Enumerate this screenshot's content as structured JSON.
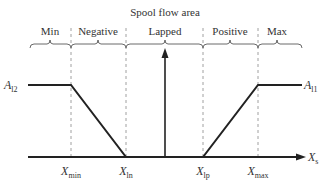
{
  "title": "Spool flow area",
  "regions": [
    {
      "label": "Min",
      "x": 50
    },
    {
      "label": "Negative",
      "x": 98
    },
    {
      "label": "Lapped",
      "x": 165
    },
    {
      "label": "Positive",
      "x": 230
    },
    {
      "label": "Max",
      "x": 277
    }
  ],
  "y_labels": {
    "left": {
      "main": "A",
      "sub": "l2"
    },
    "right": {
      "main": "A",
      "sub": "l1"
    }
  },
  "x_axis": {
    "main": "X",
    "sub": "s"
  },
  "x_ticks": [
    {
      "main": "X",
      "sub": "min",
      "x": 71
    },
    {
      "main": "X",
      "sub": "ln",
      "x": 126
    },
    {
      "main": "X",
      "sub": "lp",
      "x": 203
    },
    {
      "main": "X",
      "sub": "max",
      "x": 258
    }
  ],
  "colors": {
    "line": "#222222",
    "dashed": "#888888",
    "text": "#333333"
  }
}
